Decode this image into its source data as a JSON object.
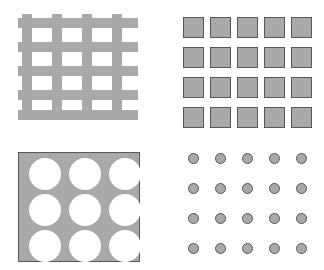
{
  "figure": {
    "width": 324,
    "height": 270,
    "background": "#ffffff",
    "panel_count": 4,
    "layout": "2x2"
  },
  "colors": {
    "fill_gray": "#a9a9a9",
    "stroke_dark": "#575757",
    "background": "#ffffff",
    "hole_white": "#ffffff"
  },
  "panels": [
    {
      "id": "mesh",
      "name": "woven-mesh-panel",
      "position": "top-left",
      "description": "Crossing orthogonal bars forming a woven grid",
      "origin": {
        "x": 0,
        "y": 0
      },
      "size": {
        "width": 162,
        "height": 135
      },
      "pattern": {
        "type": "grid-bars",
        "vertical_bars": 4,
        "horizontal_bars": 5,
        "bar_thickness": 10,
        "bar_color": "#a9a9a9",
        "extent": {
          "left": 18,
          "top": 14,
          "right": 138,
          "bottom": 118
        },
        "vertical_x": [
          22,
          52,
          82,
          112
        ],
        "vertical_span": {
          "top": 14,
          "bottom": 118
        },
        "horizontal_y": [
          18,
          42,
          66,
          90,
          110
        ],
        "horizontal_span": {
          "left": 18,
          "right": 138
        }
      }
    },
    {
      "id": "squares",
      "name": "square-array-panel",
      "position": "top-right",
      "description": "Regular array of outlined gray squares",
      "origin": {
        "x": 162,
        "y": 0
      },
      "size": {
        "width": 162,
        "height": 135
      },
      "pattern": {
        "type": "square-array",
        "columns": 5,
        "rows": 4,
        "count": 20,
        "cell_size": 21,
        "pitch_x": 27,
        "pitch_y": 30,
        "first_x": 21,
        "first_y": 17,
        "fill": "#a9a9a9",
        "stroke": "#575757",
        "stroke_width": 1.5
      }
    },
    {
      "id": "perforated",
      "name": "perforated-plate-panel",
      "position": "bottom-left",
      "description": "Solid gray plate with a 3x3 array of circular holes",
      "origin": {
        "x": 0,
        "y": 135
      },
      "size": {
        "width": 162,
        "height": 135
      },
      "pattern": {
        "type": "perforated-plate",
        "plate": {
          "x": 18,
          "y": 17,
          "width": 122,
          "height": 110
        },
        "columns": 3,
        "rows": 3,
        "count": 9,
        "hole_diameter": 32,
        "pitch_x": 40,
        "pitch_y": 36,
        "first_cx": 44,
        "first_cy": 38,
        "plate_fill": "#a9a9a9",
        "plate_stroke": "#575757",
        "hole_fill": "#ffffff"
      }
    },
    {
      "id": "dots",
      "name": "dot-array-panel",
      "position": "bottom-right",
      "description": "Regular array of small outlined gray circles",
      "origin": {
        "x": 162,
        "y": 135
      },
      "size": {
        "width": 162,
        "height": 135
      },
      "pattern": {
        "type": "circle-array",
        "columns": 5,
        "rows": 4,
        "count": 20,
        "diameter": 11,
        "pitch_x": 27,
        "pitch_y": 30,
        "first_cx": 31,
        "first_cy": 23,
        "fill": "#a9a9a9",
        "stroke": "#575757",
        "stroke_width": 1.5
      }
    }
  ]
}
